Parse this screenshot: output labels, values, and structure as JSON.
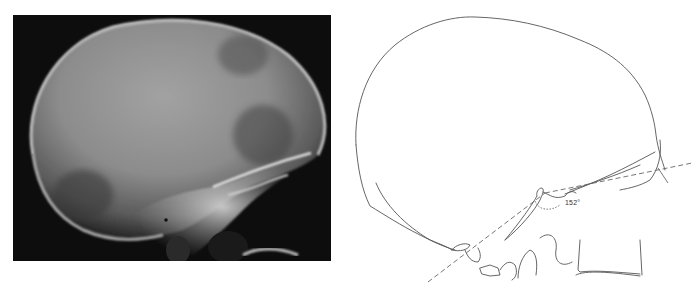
{
  "figure": {
    "panels": [
      {
        "id": "a",
        "kind": "radiograph",
        "description": "Lateral skull X-ray"
      },
      {
        "id": "b",
        "kind": "line-tracing",
        "description": "Line tracing of lateral skull with basal angle",
        "annotation": {
          "angle_label": "152°"
        }
      }
    ],
    "colors": {
      "xray_background": "#0d0d0d",
      "bone_bright": "#d8d8d8",
      "skull_fill": "#8a8a8a",
      "tracing_line": "#555555",
      "page_background": "#ffffff"
    }
  }
}
